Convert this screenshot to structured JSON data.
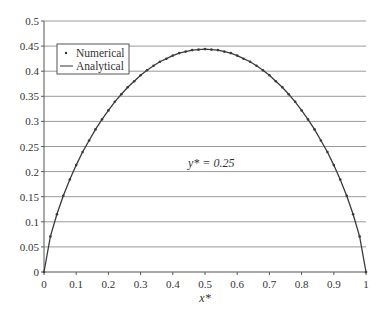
{
  "chart_data": {
    "type": "line",
    "title": "",
    "xlabel": "x*",
    "ylabel": "",
    "annotation": "y* = 0.25",
    "xlim": [
      0,
      1
    ],
    "ylim": [
      0,
      0.5
    ],
    "grid": {
      "horizontal": true,
      "vertical": false
    },
    "legend": {
      "position": "upper-left",
      "entries": [
        "Numerical",
        "Analytical"
      ]
    },
    "x_ticks": [
      "0",
      "0.1",
      "0.2",
      "0.3",
      "0.4",
      "0.5",
      "0.6",
      "0.7",
      "0.8",
      "0.9",
      "1"
    ],
    "y_ticks": [
      "0",
      "0.05",
      "0.1",
      "0.15",
      "0.2",
      "0.25",
      "0.3",
      "0.35",
      "0.4",
      "0.45",
      "0.5"
    ],
    "x": [
      0,
      0.02,
      0.04,
      0.06,
      0.08,
      0.1,
      0.12,
      0.14,
      0.16,
      0.18,
      0.2,
      0.22,
      0.24,
      0.26,
      0.28,
      0.3,
      0.32,
      0.34,
      0.36,
      0.38,
      0.4,
      0.42,
      0.44,
      0.46,
      0.48,
      0.5,
      0.52,
      0.54,
      0.56,
      0.58,
      0.6,
      0.62,
      0.64,
      0.66,
      0.68,
      0.7,
      0.72,
      0.74,
      0.76,
      0.78,
      0.8,
      0.82,
      0.84,
      0.86,
      0.88,
      0.9,
      0.92,
      0.94,
      0.96,
      0.98,
      1.0
    ],
    "series": [
      {
        "name": "Numerical",
        "style": "dots",
        "values": [
          0,
          0.071,
          0.115,
          0.152,
          0.184,
          0.213,
          0.239,
          0.262,
          0.284,
          0.304,
          0.322,
          0.339,
          0.354,
          0.368,
          0.38,
          0.392,
          0.402,
          0.411,
          0.419,
          0.425,
          0.431,
          0.436,
          0.439,
          0.442,
          0.443,
          0.444,
          0.443,
          0.442,
          0.439,
          0.436,
          0.431,
          0.425,
          0.419,
          0.411,
          0.402,
          0.392,
          0.38,
          0.368,
          0.354,
          0.339,
          0.322,
          0.304,
          0.284,
          0.262,
          0.239,
          0.213,
          0.184,
          0.152,
          0.115,
          0.071,
          0
        ]
      },
      {
        "name": "Analytical",
        "style": "line",
        "values": [
          0,
          0.071,
          0.115,
          0.152,
          0.184,
          0.213,
          0.239,
          0.262,
          0.284,
          0.304,
          0.322,
          0.339,
          0.354,
          0.368,
          0.38,
          0.392,
          0.402,
          0.411,
          0.419,
          0.425,
          0.431,
          0.436,
          0.439,
          0.442,
          0.443,
          0.444,
          0.443,
          0.442,
          0.439,
          0.436,
          0.431,
          0.425,
          0.419,
          0.411,
          0.402,
          0.392,
          0.38,
          0.368,
          0.354,
          0.339,
          0.322,
          0.304,
          0.284,
          0.262,
          0.239,
          0.213,
          0.184,
          0.152,
          0.115,
          0.071,
          0
        ]
      }
    ],
    "colors": {
      "line": "#3a3a3a",
      "grid": "#9a9a9a",
      "axis": "#555555",
      "text": "#333333"
    }
  }
}
